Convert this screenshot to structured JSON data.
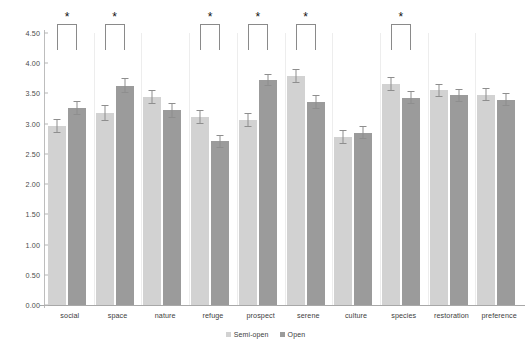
{
  "chart_data": {
    "type": "bar",
    "title": "",
    "xlabel": "",
    "ylabel": "",
    "ylim": [
      0.0,
      4.5
    ],
    "ytick_step": 0.5,
    "grid": false,
    "legend_position": "bottom",
    "yticks": [
      "0.00",
      "0.50",
      "1.00",
      "1.50",
      "2.00",
      "2.50",
      "3.00",
      "3.50",
      "4.00",
      "4.50"
    ],
    "categories": [
      "social",
      "space",
      "nature",
      "refuge",
      "prospect",
      "serene",
      "culture",
      "species",
      "restoration",
      "preference"
    ],
    "series": [
      {
        "name": "Semi-open",
        "color": "#d2d2d2",
        "values": [
          2.96,
          3.18,
          3.44,
          3.11,
          3.06,
          3.79,
          2.78,
          3.66,
          3.55,
          3.48
        ],
        "errors": [
          0.12,
          0.13,
          0.11,
          0.12,
          0.11,
          0.12,
          0.11,
          0.12,
          0.11,
          0.11
        ]
      },
      {
        "name": "Open",
        "color": "#9b9b9b",
        "values": [
          3.26,
          3.63,
          3.22,
          2.71,
          3.72,
          3.36,
          2.85,
          3.43,
          3.47,
          3.4
        ],
        "errors": [
          0.12,
          0.12,
          0.12,
          0.11,
          0.1,
          0.12,
          0.11,
          0.11,
          0.11,
          0.11
        ]
      }
    ],
    "annotations": [
      {
        "category": "social",
        "label": "*",
        "significant": true
      },
      {
        "category": "space",
        "label": "*",
        "significant": true
      },
      {
        "category": "nature",
        "label": "",
        "significant": false
      },
      {
        "category": "refuge",
        "label": "*",
        "significant": true
      },
      {
        "category": "prospect",
        "label": "*",
        "significant": true
      },
      {
        "category": "serene",
        "label": "*",
        "significant": true
      },
      {
        "category": "culture",
        "label": "",
        "significant": false
      },
      {
        "category": "species",
        "label": "*",
        "significant": true
      },
      {
        "category": "restoration",
        "label": "",
        "significant": false
      },
      {
        "category": "preference",
        "label": "",
        "significant": false
      }
    ]
  },
  "legend": {
    "items": [
      {
        "label": "Semi-open",
        "swatch": "semi"
      },
      {
        "label": "Open",
        "swatch": "open"
      }
    ]
  }
}
